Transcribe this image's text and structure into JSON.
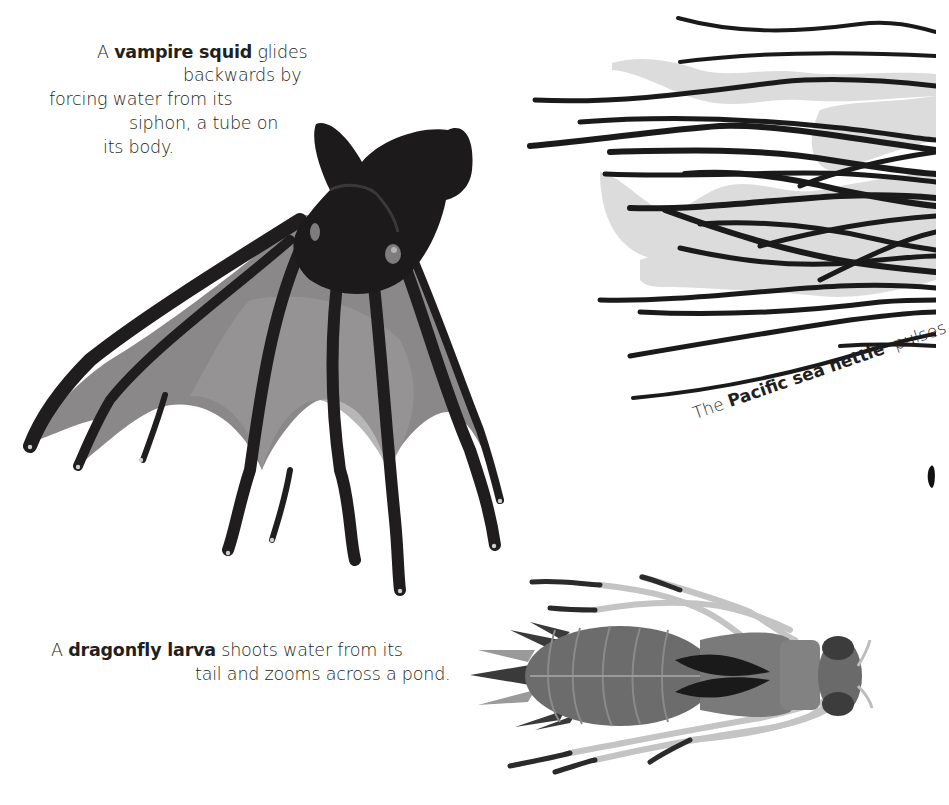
{
  "page": {
    "background": "#ffffff",
    "text_color": "#231f20"
  },
  "squid_caption": {
    "line1_prefix": "A ",
    "line1_bold": "vampire squid",
    "line1_suffix": " glides",
    "line2": "backwards by",
    "line3": "forcing water from its",
    "line4": "siphon, a tube on",
    "line5": "its body."
  },
  "nettle_caption": {
    "prefix": "The ",
    "bold": "Pacific sea nettle",
    "suffix": "  pulses"
  },
  "larva_caption": {
    "line1_prefix": "A ",
    "line1_bold": "dragonfly larva",
    "line1_suffix": " shoots water from its",
    "line2": "tail and zooms across a pond."
  },
  "illustrations": {
    "squid": {
      "label": "vampire squid illustration",
      "body_color": "#1c1a1b",
      "web_color": "#7a7879"
    },
    "sea_nettle": {
      "label": "Pacific sea nettle tentacles illustration",
      "tentacle_color": "#1a1a1a",
      "oral_arm_color": "#d6d6d6"
    },
    "larva": {
      "label": "dragonfly larva illustration",
      "body_color": "#6e6e6e",
      "leg_color": "#c8c8c8",
      "wing_pad_color": "#1a1a1a"
    }
  }
}
